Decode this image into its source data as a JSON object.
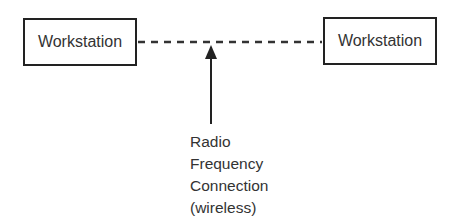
{
  "diagram": {
    "nodes": [
      {
        "id": "left",
        "label": "Workstation"
      },
      {
        "id": "right",
        "label": "Workstation"
      }
    ],
    "edges": [
      {
        "from": "left",
        "to": "right",
        "style": "dashed",
        "label": "Radio Frequency Connection (wireless)"
      }
    ],
    "annotation": {
      "lines": [
        "Radio",
        "Frequency",
        "Connection",
        "(wireless)"
      ],
      "pointer": "arrow-up"
    },
    "colors": {
      "stroke": "#222222",
      "text": "#333333",
      "background": "#ffffff"
    }
  }
}
